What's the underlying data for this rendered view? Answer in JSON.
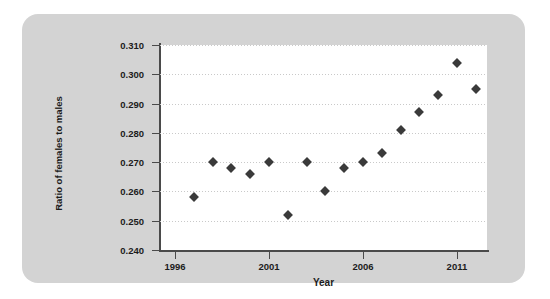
{
  "chart_data": {
    "type": "scatter",
    "title": "",
    "xlabel": "Year",
    "ylabel": "Ratio of females to males",
    "xlim": [
      1995.2,
      2012.6
    ],
    "ylim": [
      0.24,
      0.31
    ],
    "xticks": [
      1996,
      2001,
      2006,
      2011
    ],
    "yticks": [
      0.24,
      0.25,
      0.26,
      0.27,
      0.28,
      0.29,
      0.3,
      0.31
    ],
    "ytick_labels": [
      "0.240",
      "0.250",
      "0.260",
      "0.270",
      "0.280",
      "0.290",
      "0.300",
      "0.310"
    ],
    "xtick_labels": [
      "1996",
      "2001",
      "2006",
      "2011"
    ],
    "grid": "horizontal-dotted",
    "legend": "none",
    "marker": "diamond",
    "marker_color": "#3a3a3a",
    "x": [
      1997,
      1998,
      1999,
      2000,
      2001,
      2002,
      2003,
      2004,
      2005,
      2006,
      2007,
      2008,
      2009,
      2010,
      2011,
      2012
    ],
    "values": [
      0.258,
      0.27,
      0.268,
      0.266,
      0.27,
      0.252,
      0.27,
      0.26,
      0.268,
      0.27,
      0.273,
      0.281,
      0.287,
      0.293,
      0.304,
      0.295
    ],
    "points": [
      {
        "year": 1997,
        "ratio": 0.258
      },
      {
        "year": 1998,
        "ratio": 0.27
      },
      {
        "year": 1999,
        "ratio": 0.268
      },
      {
        "year": 2000,
        "ratio": 0.266
      },
      {
        "year": 2001,
        "ratio": 0.27
      },
      {
        "year": 2002,
        "ratio": 0.252
      },
      {
        "year": 2003,
        "ratio": 0.27
      },
      {
        "year": 2004,
        "ratio": 0.26
      },
      {
        "year": 2005,
        "ratio": 0.268
      },
      {
        "year": 2006,
        "ratio": 0.27
      },
      {
        "year": 2007,
        "ratio": 0.273
      },
      {
        "year": 2008,
        "ratio": 0.281
      },
      {
        "year": 2009,
        "ratio": 0.287
      },
      {
        "year": 2010,
        "ratio": 0.293
      },
      {
        "year": 2011,
        "ratio": 0.304
      },
      {
        "year": 2012,
        "ratio": 0.295
      }
    ]
  },
  "colors": {
    "card_background": "#d3d3d3",
    "plot_background": "#ffffff",
    "axis": "#4a4a4a",
    "grid": "#c9c9c9",
    "marker": "#3a3a3a",
    "text": "#1c1c1c"
  }
}
